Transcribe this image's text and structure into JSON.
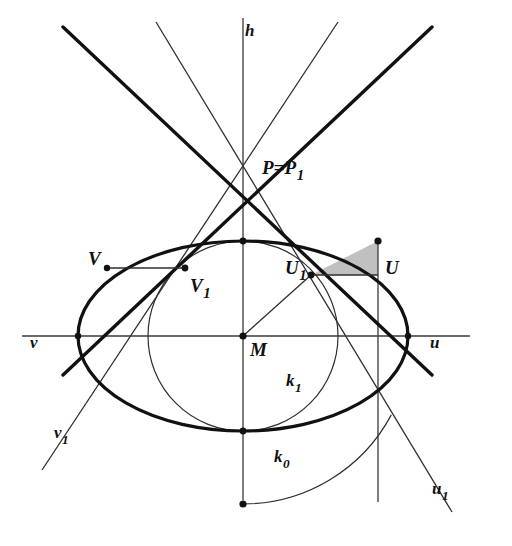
{
  "figure": {
    "background_color": "#ffffff",
    "ink_color": "#111111",
    "thin_color": "#3a3a3a",
    "shade_color": "#a8a8a8",
    "width": 512,
    "height": 546
  },
  "labels": {
    "h": {
      "text": "h",
      "sub": ""
    },
    "P": {
      "text": "P=P",
      "sub": "1"
    },
    "U": {
      "text": "U",
      "sub": ""
    },
    "U1": {
      "text": "U",
      "sub": "1"
    },
    "V": {
      "text": "V",
      "sub": ""
    },
    "V1": {
      "text": "V",
      "sub": "1"
    },
    "M": {
      "text": "M",
      "sub": ""
    },
    "u": {
      "text": "u",
      "sub": ""
    },
    "u1": {
      "text": "u",
      "sub": "1"
    },
    "v": {
      "text": "v",
      "sub": ""
    },
    "v1": {
      "text": "v",
      "sub": "1"
    },
    "k0": {
      "text": "k",
      "sub": "0"
    },
    "k1": {
      "text": "k",
      "sub": "1"
    }
  },
  "points": {
    "M": {
      "x": 243,
      "y": 336,
      "marked": true
    },
    "P": {
      "x": 243,
      "y": 167,
      "marked": false
    },
    "U": {
      "x": 378,
      "y": 275,
      "marked": true
    },
    "U1": {
      "x": 311,
      "y": 275,
      "marked": true
    },
    "V": {
      "x": 107,
      "y": 268,
      "marked": true
    },
    "V1": {
      "x": 185,
      "y": 268,
      "marked": true
    },
    "ellipse_top": {
      "x": 243,
      "y": 241,
      "marked": true
    },
    "ellipse_bottom": {
      "x": 243,
      "y": 431,
      "marked": true
    },
    "ellipse_left": {
      "x": 78,
      "y": 336,
      "marked": true
    },
    "ellipse_right": {
      "x": 408,
      "y": 336,
      "marked": true
    },
    "k0_end": {
      "x": 243,
      "y": 504,
      "marked": true
    }
  },
  "ellipse": {
    "cx": 243,
    "cy": 336,
    "rx": 165,
    "ry": 95,
    "stroke_width": 3.2
  },
  "circle_k1": {
    "cx": 243,
    "cy": 336,
    "r": 95,
    "stroke_width": 1.2
  },
  "arc_k0": {
    "cx": 243,
    "cy": 336,
    "r": 168,
    "stroke_width": 1.2,
    "from_deg": 28,
    "to_deg": 90
  },
  "lines": {
    "h_axis": {
      "x1": 243,
      "y1": 18,
      "x2": 243,
      "y2": 500,
      "width": 1.3
    },
    "horizontal_axis": {
      "x1": 22,
      "y1": 336,
      "x2": 470,
      "y2": 336,
      "width": 1.3
    },
    "thick_u": {
      "x1": 63,
      "y1": 27,
      "x2": 432,
      "y2": 375,
      "width": 3.4
    },
    "thick_v": {
      "x1": 432,
      "y1": 27,
      "x2": 63,
      "y2": 375,
      "width": 3.4
    },
    "thin_u1": {
      "x1": 156,
      "y1": 22,
      "x2": 452,
      "y2": 512,
      "width": 1.3
    },
    "thin_v1": {
      "x1": 338,
      "y1": 22,
      "x2": 42,
      "y2": 470,
      "width": 1.3
    },
    "vertical_through_U": {
      "x1": 378,
      "y1": 241,
      "x2": 378,
      "y2": 502,
      "width": 1.3
    },
    "segment_V_V1": {
      "x1": 107,
      "y1": 268,
      "x2": 185,
      "y2": 268,
      "width": 1.3
    },
    "segment_U1_U": {
      "x1": 311,
      "y1": 275,
      "x2": 378,
      "y2": 275,
      "width": 1.3
    },
    "segment_M_U1": {
      "x1": 243,
      "y1": 336,
      "x2": 311,
      "y2": 275,
      "width": 1.3
    }
  },
  "shaded_triangle": {
    "points": "311,275 378,275 378,241",
    "fill": "#a8a8a8",
    "opacity": 0.72
  },
  "label_positions": {
    "h": {
      "left": 245,
      "top": 22
    },
    "P": {
      "left": 262,
      "top": 158
    },
    "U": {
      "left": 385,
      "top": 258
    },
    "U1": {
      "left": 285,
      "top": 258
    },
    "V": {
      "left": 88,
      "top": 249
    },
    "V1": {
      "left": 190,
      "top": 276
    },
    "M": {
      "left": 250,
      "top": 340
    },
    "u": {
      "left": 430,
      "top": 334
    },
    "u1": {
      "left": 432,
      "top": 480
    },
    "v": {
      "left": 30,
      "top": 334
    },
    "v1": {
      "left": 54,
      "top": 424
    },
    "k0": {
      "left": 274,
      "top": 448
    },
    "k1": {
      "left": 286,
      "top": 372
    }
  }
}
